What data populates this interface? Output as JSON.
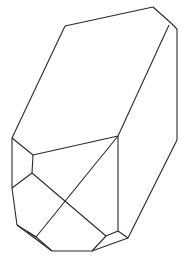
{
  "figure": {
    "stroke_color": "#2a2a2a",
    "background": "#ffffff",
    "edges": [
      [
        65,
        26,
        153,
        7
      ],
      [
        153,
        7,
        171,
        23
      ],
      [
        171,
        23,
        177,
        29
      ],
      [
        177,
        29,
        177,
        140
      ],
      [
        65,
        26,
        12,
        138
      ],
      [
        169,
        25,
        118,
        136
      ],
      [
        177,
        140,
        128,
        238
      ],
      [
        12,
        138,
        33,
        155
      ],
      [
        33,
        155,
        118,
        136
      ],
      [
        33,
        155,
        32,
        173
      ],
      [
        32,
        173,
        12,
        188
      ],
      [
        32,
        173,
        106,
        236
      ],
      [
        118,
        136,
        36,
        237
      ],
      [
        118,
        136,
        118,
        231
      ],
      [
        12,
        138,
        12,
        188
      ],
      [
        12,
        188,
        17,
        225
      ],
      [
        17,
        225,
        52,
        251
      ],
      [
        52,
        251,
        92,
        251
      ],
      [
        17,
        225,
        36,
        237
      ],
      [
        36,
        237,
        52,
        251
      ],
      [
        36,
        237,
        28,
        232
      ],
      [
        92,
        251,
        106,
        236
      ],
      [
        106,
        236,
        118,
        231
      ],
      [
        118,
        231,
        128,
        238
      ],
      [
        92,
        251,
        128,
        238
      ]
    ]
  }
}
